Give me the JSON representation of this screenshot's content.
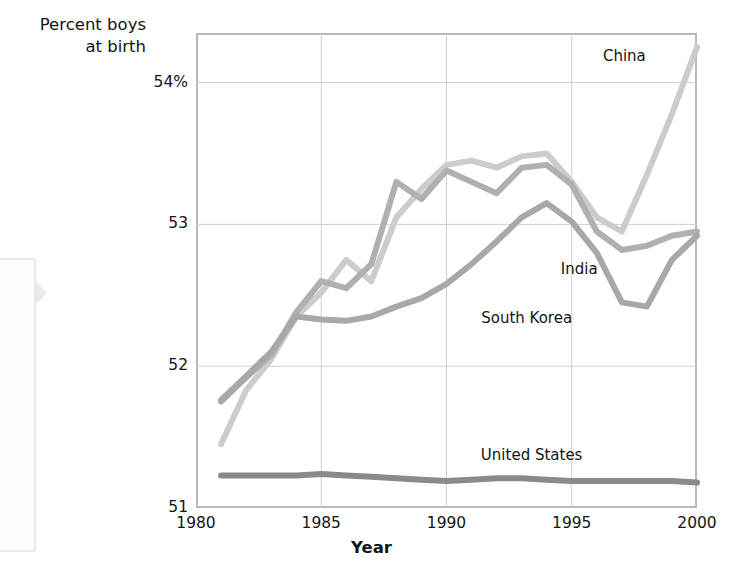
{
  "chart_data": {
    "type": "line",
    "title": "",
    "xlabel": "Year",
    "ylabel": "Percent boys at birth",
    "xlim": [
      1980,
      2000
    ],
    "ylim": [
      51,
      54.35
    ],
    "grid": true,
    "legend_position": "inline-right",
    "x_ticks": [
      "1980",
      "1985",
      "1990",
      "1995",
      "2000"
    ],
    "x_tick_values": [
      1980,
      1985,
      1990,
      1995,
      2000
    ],
    "y_ticks": [
      "51",
      "52",
      "53",
      "54%"
    ],
    "y_tick_values": [
      51,
      52,
      53,
      54
    ],
    "x": [
      1981,
      1982,
      1983,
      1984,
      1985,
      1986,
      1987,
      1988,
      1989,
      1990,
      1991,
      1992,
      1993,
      1994,
      1995,
      1996,
      1997,
      1998,
      1999,
      2000
    ],
    "series": [
      {
        "name": "China",
        "color": "#cccccc",
        "values": [
          51.45,
          51.83,
          52.05,
          52.35,
          52.52,
          52.75,
          52.6,
          53.05,
          53.25,
          53.42,
          53.45,
          53.4,
          53.48,
          53.5,
          53.3,
          53.05,
          52.95,
          53.35,
          53.78,
          54.25
        ]
      },
      {
        "name": "India",
        "color": "#b0b0b0",
        "values": [
          51.75,
          51.92,
          52.08,
          52.38,
          52.6,
          52.55,
          52.72,
          53.3,
          53.18,
          53.38,
          53.3,
          53.22,
          53.4,
          53.42,
          53.28,
          52.95,
          52.82,
          52.85,
          52.92,
          52.95
        ]
      },
      {
        "name": "South Korea",
        "color": "#a8a8a8",
        "values": [
          51.76,
          51.93,
          52.1,
          52.35,
          52.33,
          52.32,
          52.35,
          52.42,
          52.48,
          52.58,
          52.72,
          52.88,
          53.05,
          53.15,
          53.02,
          52.8,
          52.45,
          52.42,
          52.75,
          52.92
        ]
      },
      {
        "name": "United States",
        "color": "#8a8a8a",
        "values": [
          51.23,
          51.23,
          51.23,
          51.23,
          51.24,
          51.23,
          51.22,
          51.21,
          51.2,
          51.19,
          51.2,
          51.21,
          51.21,
          51.2,
          51.19,
          51.19,
          51.19,
          51.19,
          51.19,
          51.18
        ]
      }
    ],
    "annotations": [
      {
        "text": "China",
        "x": 1997.1,
        "y": 54.18
      },
      {
        "text": "India",
        "x": 1995.3,
        "y": 52.68
      },
      {
        "text": "South Korea",
        "x": 1993.2,
        "y": 52.33
      },
      {
        "text": "United States",
        "x": 1993.4,
        "y": 51.37
      }
    ]
  },
  "axes": {
    "y_title": "Percent boys\nat birth",
    "x_title": "Year"
  }
}
